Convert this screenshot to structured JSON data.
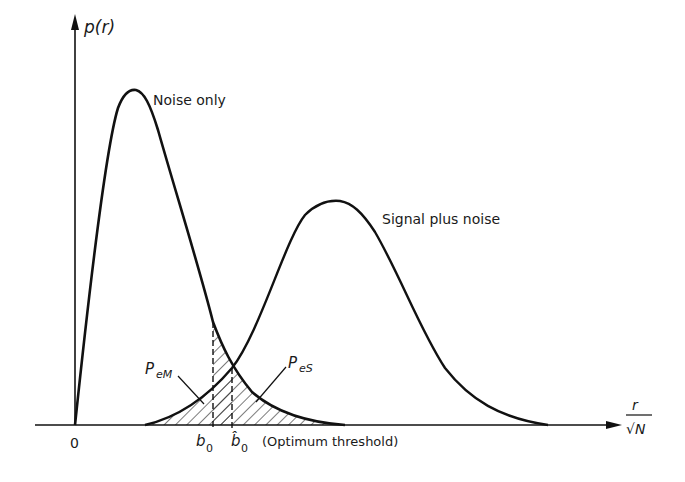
{
  "figure": {
    "y_axis_label": "p(r)",
    "x_axis_label_num": "r",
    "x_axis_label_den": "√N",
    "origin_label": "0",
    "curves": [
      {
        "name": "noise-only",
        "label": "Noise only",
        "shape": "Rayleigh",
        "peak": [
          132,
          92
        ]
      },
      {
        "name": "signal-plus-noise",
        "label": "Signal plus noise",
        "shape": "Rician",
        "peak": [
          338,
          202
        ]
      }
    ],
    "region_labels": {
      "miss": {
        "main": "P",
        "sub": "eM"
      },
      "false_alarm": {
        "main": "P",
        "sub": "eS"
      }
    },
    "thresholds": {
      "b0": {
        "main": "b",
        "sub": "0"
      },
      "b0_hat": {
        "main": "b̂",
        "sub": "0"
      },
      "optimum_note": "(Optimum threshold)"
    },
    "colors": {
      "ink": "#111111",
      "background": "#ffffff"
    }
  }
}
